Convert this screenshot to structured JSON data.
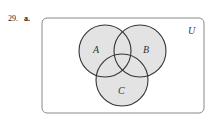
{
  "problem": {
    "number": "29.",
    "part": "a."
  },
  "diagram": {
    "universe_label": "U",
    "sets": [
      {
        "label": "A",
        "cx": 105,
        "cy": 51,
        "r": 26
      },
      {
        "label": "B",
        "cx": 140,
        "cy": 51,
        "r": 26
      },
      {
        "label": "C",
        "cx": 122,
        "cy": 80,
        "r": 26
      }
    ],
    "fill_color": "#e3e3e3",
    "stroke_color": "#333333",
    "universe_stroke": "#888888"
  }
}
